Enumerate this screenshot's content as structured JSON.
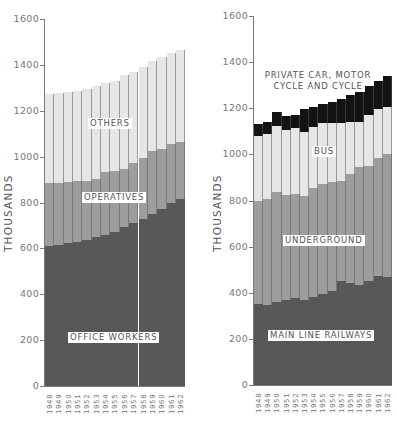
{
  "chart_data": [
    {
      "type": "bar",
      "stacked": true,
      "title": "",
      "xlabel": "",
      "ylabel": "THOUSANDS",
      "ylim": [
        0,
        1600
      ],
      "yticks": [
        0,
        200,
        400,
        600,
        800,
        1000,
        1200,
        1400,
        1600
      ],
      "grid": false,
      "categories": [
        "1948",
        "1949",
        "1950",
        "1951",
        "1952",
        "1953",
        "1954",
        "1955",
        "1956",
        "1957",
        "1958",
        "1959",
        "1960",
        "1961",
        "1962"
      ],
      "series": [
        {
          "name": "OFFICE WORKERS",
          "values": [
            612,
            616,
            622,
            629,
            636,
            648,
            658,
            673,
            695,
            709,
            727,
            750,
            771,
            799,
            814
          ]
        },
        {
          "name": "OPERATIVES",
          "values": [
            271,
            270,
            267,
            263,
            258,
            253,
            273,
            263,
            249,
            264,
            265,
            273,
            261,
            256,
            251
          ]
        },
        {
          "name": "OTHERS",
          "values": [
            392,
            393,
            393,
            395,
            402,
            408,
            391,
            392,
            410,
            398,
            400,
            395,
            401,
            395,
            400
          ]
        }
      ],
      "totals": [
        1275,
        1279,
        1282,
        1287,
        1296,
        1309,
        1322,
        1328,
        1354,
        1371,
        1392,
        1418,
        1433,
        1450,
        1465
      ]
    },
    {
      "type": "bar",
      "stacked": true,
      "title": "",
      "xlabel": "",
      "ylabel": "THOUSANDS",
      "ylim": [
        0,
        1600
      ],
      "yticks": [
        0,
        200,
        400,
        600,
        800,
        1000,
        1200,
        1400,
        1600
      ],
      "grid": false,
      "categories": [
        "1948",
        "1949",
        "1950",
        "1951",
        "1952",
        "1953",
        "1954",
        "1955",
        "1956",
        "1957",
        "1958",
        "1959",
        "1960",
        "1961",
        "1962"
      ],
      "series": [
        {
          "name": "MAIN LINE RAILWAYS",
          "values": [
            351,
            347,
            361,
            369,
            379,
            369,
            383,
            395,
            408,
            452,
            441,
            434,
            452,
            474,
            470
          ]
        },
        {
          "name": "UNDERGROUND",
          "values": [
            447,
            458,
            477,
            455,
            449,
            452,
            470,
            475,
            474,
            431,
            474,
            510,
            499,
            509,
            532
          ]
        },
        {
          "name": "BUS",
          "values": [
            282,
            283,
            285,
            282,
            285,
            275,
            264,
            265,
            253,
            252,
            224,
            198,
            220,
            213,
            205
          ]
        },
        {
          "name": "PRIVATE CAR, MOTOR CYCLE AND CYCLE",
          "values": [
            52,
            54,
            60,
            61,
            58,
            100,
            87,
            84,
            94,
            107,
            119,
            140,
            126,
            122,
            134
          ]
        }
      ],
      "totals": [
        1132,
        1142,
        1183,
        1167,
        1171,
        1196,
        1204,
        1219,
        1229,
        1242,
        1258,
        1282,
        1297,
        1318,
        1341
      ]
    }
  ],
  "left": {
    "ylabel": "THOUSANDS",
    "labels": {
      "others": "OTHERS",
      "operatives": "OPERATIVES",
      "office": "OFFICE WORKERS"
    }
  },
  "right": {
    "ylabel": "THOUSANDS",
    "labels": {
      "car_line1": "PRIVATE CAR, MOTOR",
      "car_line2": "CYCLE AND CYCLE",
      "bus": "BUS",
      "underground": "UNDERGROUND",
      "rail": "MAIN LINE RAILWAYS"
    }
  }
}
